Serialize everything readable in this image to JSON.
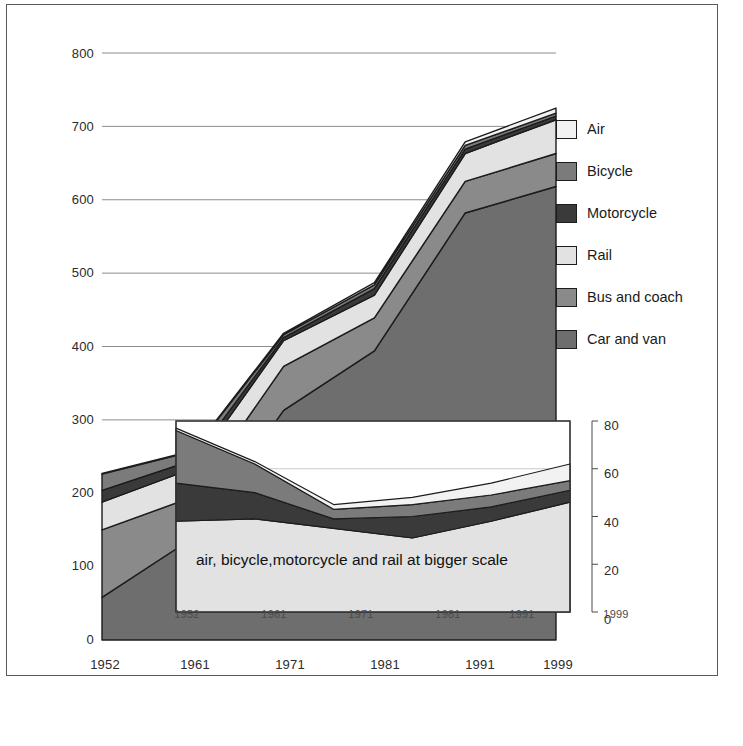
{
  "chart_data": {
    "type": "area",
    "title": "",
    "subtitle": "",
    "xlabel": "",
    "ylabel": "",
    "stacked": true,
    "grid": true,
    "legend_position": "right",
    "categories": [
      "1952",
      "1961",
      "1971",
      "1981",
      "1991",
      "1999"
    ],
    "x_tick_labels": [
      "1952",
      "1961",
      "1971",
      "1981",
      "1991",
      "1999"
    ],
    "y_tick_labels": [
      "0",
      "100",
      "200",
      "300",
      "400",
      "500",
      "600",
      "700",
      "800"
    ],
    "ylim": [
      0,
      800
    ],
    "y_ticks": [
      0,
      100,
      200,
      300,
      400,
      500,
      600,
      700,
      800
    ],
    "series": [
      {
        "name": "Car and van",
        "color": "#6e6e6e",
        "values": [
          58,
          139,
          313,
          394,
          582,
          618
        ]
      },
      {
        "name": "Bus and coach",
        "color": "#8a8a8a",
        "values": [
          92,
          56,
          60,
          45,
          43,
          45
        ]
      },
      {
        "name": "Rail",
        "color": "#e2e2e2",
        "values": [
          38,
          39,
          35,
          31,
          38,
          46
        ]
      },
      {
        "name": "Motorcycle",
        "color": "#3a3a3a",
        "values": [
          16,
          11,
          4,
          9,
          6,
          5
        ]
      },
      {
        "name": "Bicycle",
        "color": "#7b7b7b",
        "values": [
          22,
          12,
          4,
          5,
          5,
          4
        ]
      },
      {
        "name": "Air",
        "color": "#f2f2f2",
        "values": [
          1,
          1,
          2,
          3,
          5,
          7
        ]
      }
    ],
    "totals": [
      227,
      258,
      418,
      487,
      679,
      725
    ],
    "inset": {
      "type": "area",
      "stacked": true,
      "caption": "air, bicycle,motorcycle and rail at bigger scale",
      "categories": [
        "1952",
        "1961",
        "1971",
        "1981",
        "1991",
        "1999"
      ],
      "x_tick_labels": [
        "1952",
        "1961",
        "1971",
        "1981",
        "1991",
        "1999"
      ],
      "y_tick_labels": [
        "0",
        "20",
        "40",
        "60",
        "80"
      ],
      "y_ticks": [
        0,
        20,
        40,
        60,
        80
      ],
      "ylim": [
        0,
        80
      ],
      "axis_side": "right",
      "series": [
        {
          "name": "Rail",
          "color": "#e2e2e2",
          "values": [
            38,
            39,
            35,
            31,
            38,
            46
          ]
        },
        {
          "name": "Motorcycle",
          "color": "#3a3a3a",
          "values": [
            16,
            11,
            4,
            9,
            6,
            5
          ]
        },
        {
          "name": "Bicycle",
          "color": "#7b7b7b",
          "values": [
            22,
            12,
            4,
            5,
            5,
            4
          ]
        },
        {
          "name": "Air",
          "color": "#f2f2f2",
          "values": [
            1,
            1,
            2,
            3,
            5,
            7
          ]
        }
      ]
    }
  },
  "axes": {
    "y_ticks": [
      {
        "label": "800",
        "top": 46
      },
      {
        "label": "700",
        "top": 119
      },
      {
        "label": "600",
        "top": 192
      },
      {
        "label": "500",
        "top": 265
      },
      {
        "label": "400",
        "top": 339
      },
      {
        "label": "300",
        "top": 412
      },
      {
        "label": "200",
        "top": 485
      },
      {
        "label": "100",
        "top": 558
      },
      {
        "label": "0",
        "top": 632
      }
    ],
    "x_ticks": [
      {
        "label": "1952",
        "left": 75
      },
      {
        "label": "1961",
        "left": 165
      },
      {
        "label": "1971",
        "left": 260
      },
      {
        "label": "1981",
        "left": 355
      },
      {
        "label": "1991",
        "left": 450
      },
      {
        "label": "1999",
        "left": 528
      }
    ]
  },
  "inset_axes": {
    "y_ticks": [
      {
        "label": "80",
        "top": 418
      },
      {
        "label": "60",
        "top": 466
      },
      {
        "label": "40",
        "top": 515
      },
      {
        "label": "20",
        "top": 563
      },
      {
        "label": "0",
        "top": 612
      }
    ],
    "x_ticks": [
      {
        "label": "1952",
        "left": 159
      },
      {
        "label": "1961",
        "left": 246
      },
      {
        "label": "1971",
        "left": 333
      },
      {
        "label": "1981",
        "left": 420
      },
      {
        "label": "1991",
        "left": 494
      },
      {
        "label": "1999",
        "left": 588
      }
    ]
  },
  "legend": {
    "items": [
      {
        "label": "Air",
        "color": "#f2f2f2"
      },
      {
        "label": "Bicycle",
        "color": "#7b7b7b"
      },
      {
        "label": "Motorcycle",
        "color": "#3a3a3a"
      },
      {
        "label": "Rail",
        "color": "#e2e2e2"
      },
      {
        "label": "Bus and coach",
        "color": "#8a8a8a"
      },
      {
        "label": "Car and van",
        "color": "#6e6e6e"
      }
    ]
  },
  "inset_caption": "air, bicycle,motorcycle and rail at bigger scale",
  "colors": {
    "grid": "#8c8c8c",
    "outline": "#1c1c1c",
    "frame": "#5a5a5a",
    "background": "#ffffff",
    "text": "#1a1a1a"
  }
}
